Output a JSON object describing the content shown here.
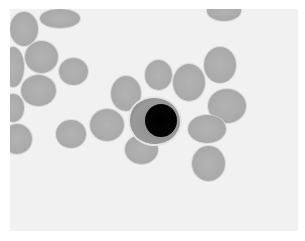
{
  "image": {
    "description": "Grayscale light micrograph of a blood smear: red blood cells surrounding a single lymphocyte with a dark round nucleus",
    "background_color": "#f1f1f1",
    "border_color": "#ffffff",
    "cell_color": "#aaaaaa",
    "nucleus_color": "#000000"
  },
  "cells": [
    {
      "type": "rbc",
      "x": 0,
      "y": 3,
      "w": 28,
      "h": 34
    },
    {
      "type": "rbc",
      "x": 30,
      "y": 0,
      "w": 40,
      "h": 19
    },
    {
      "type": "rbc",
      "x": 15,
      "y": 32,
      "w": 33,
      "h": 32
    },
    {
      "type": "rbc",
      "x": -8,
      "y": 38,
      "w": 22,
      "h": 40
    },
    {
      "type": "rbc",
      "x": 49,
      "y": 49,
      "w": 29,
      "h": 27
    },
    {
      "type": "rbc",
      "x": 11,
      "y": 66,
      "w": 35,
      "h": 31
    },
    {
      "type": "rbc",
      "x": -8,
      "y": 85,
      "w": 22,
      "h": 28
    },
    {
      "type": "rbc",
      "x": -8,
      "y": 115,
      "w": 30,
      "h": 30
    },
    {
      "type": "rbc",
      "x": 46,
      "y": 111,
      "w": 30,
      "h": 28
    },
    {
      "type": "rbc",
      "x": 80,
      "y": 100,
      "w": 34,
      "h": 32
    },
    {
      "type": "rbc",
      "x": 101,
      "y": 67,
      "w": 30,
      "h": 35
    },
    {
      "type": "rbc",
      "x": 135,
      "y": 51,
      "w": 27,
      "h": 30
    },
    {
      "type": "rbc",
      "x": 163,
      "y": 55,
      "w": 32,
      "h": 37
    },
    {
      "type": "rbc",
      "x": 194,
      "y": 38,
      "w": 32,
      "h": 36
    },
    {
      "type": "rbc",
      "x": 198,
      "y": 80,
      "w": 38,
      "h": 34
    },
    {
      "type": "rbc",
      "x": 178,
      "y": 106,
      "w": 38,
      "h": 28
    },
    {
      "type": "rbc",
      "x": 115,
      "y": 126,
      "w": 33,
      "h": 29
    },
    {
      "type": "rbc",
      "x": 182,
      "y": 137,
      "w": 33,
      "h": 35
    },
    {
      "type": "rbc",
      "x": 197,
      "y": -8,
      "w": 34,
      "h": 20
    }
  ],
  "lymphocyte": {
    "cytoplasm": {
      "x": 120,
      "y": 89,
      "w": 50,
      "h": 46
    },
    "nucleus": {
      "x": 135,
      "y": 95,
      "w": 32,
      "h": 33
    }
  }
}
